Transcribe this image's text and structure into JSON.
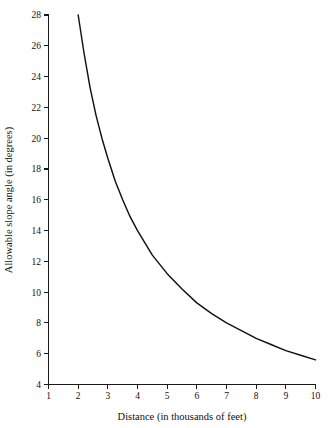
{
  "chart_data": {
    "type": "line",
    "title": "",
    "xlabel": "Distance (in thousands of feet)",
    "ylabel": "Allowable slope angle (in degrees)",
    "xlim": [
      1,
      10
    ],
    "ylim": [
      4,
      28
    ],
    "grid": false,
    "legend": "none",
    "x_ticks": [
      1,
      2,
      3,
      4,
      5,
      6,
      7,
      8,
      9,
      10
    ],
    "x_tick_labels": [
      "1",
      "2",
      "3",
      "4",
      "5",
      "6",
      "7",
      "8",
      "9",
      "10"
    ],
    "y_ticks": [
      4,
      6,
      8,
      10,
      12,
      14,
      16,
      18,
      20,
      22,
      24,
      26,
      28
    ],
    "y_tick_labels": [
      "4",
      "6",
      "8",
      "10",
      "12",
      "14",
      "16",
      "18",
      "20",
      "22",
      "24",
      "26",
      "28"
    ],
    "series": [
      {
        "name": "Allowable slope angle",
        "color": "#111111",
        "x": [
          2.0,
          2.2,
          2.4,
          2.6,
          2.8,
          3.0,
          3.25,
          3.5,
          3.75,
          4.0,
          4.25,
          4.5,
          4.75,
          5.0,
          5.5,
          6.0,
          6.5,
          7.0,
          7.5,
          8.0,
          8.5,
          9.0,
          9.5,
          10.0
        ],
        "values": [
          28.0,
          25.5,
          23.3,
          21.5,
          20.0,
          18.7,
          17.2,
          16.0,
          14.9,
          14.0,
          13.2,
          12.4,
          11.8,
          11.2,
          10.2,
          9.3,
          8.6,
          8.0,
          7.5,
          7.0,
          6.6,
          6.2,
          5.9,
          5.6
        ]
      }
    ],
    "formula_note": "y = 56 / x"
  },
  "axes": {
    "x_title": "Distance (in thousands of feet)",
    "y_title": "Allowable slope angle (in degrees)"
  },
  "colors": {
    "curve": "#111111",
    "axis": "#1a1a1a",
    "background": "#ffffff",
    "text": "#111111"
  }
}
